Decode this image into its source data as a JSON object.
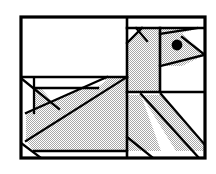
{
  "document": {
    "title": "Geometric Bird Figure",
    "kind": "line-art-illustration",
    "subject": "bird",
    "description": "Black-and-white geometric line drawing of a bird composed of straight-edged panels, diagonals and gray-filled polygons inside a rectangular frame.",
    "canvas": {
      "width": 216,
      "height": 174
    },
    "alt_text": "Angular geometric bird drawing with gray shaded body, pointed beak and round black eye, enclosed in a rectangular border."
  },
  "style": {
    "background_color": "#ffffff",
    "stroke_color": "#000000",
    "fill_gray": "#d2d2d2",
    "eye_color": "#000000",
    "frame_stroke_width": 3.2,
    "panel_stroke_width": 2.6,
    "detail_stroke_width": 2.2
  },
  "frame": {
    "name": "outer-border",
    "x": 21,
    "y": 17,
    "width": 184,
    "height": 141
  },
  "panels": [
    {
      "name": "panel-top-left",
      "x": 21,
      "y": 17,
      "width": 106,
      "height": 60,
      "fill": "white"
    },
    {
      "name": "panel-top-right-strip",
      "x": 127,
      "y": 17,
      "width": 78,
      "height": 11,
      "fill": "white"
    },
    {
      "name": "panel-head",
      "x": 127,
      "y": 28,
      "width": 78,
      "height": 64,
      "fill": "mixed"
    },
    {
      "name": "panel-mid-left",
      "x": 21,
      "y": 77,
      "width": 106,
      "height": 81,
      "fill": "mixed"
    },
    {
      "name": "panel-bottom-right",
      "x": 127,
      "y": 92,
      "width": 78,
      "height": 66,
      "fill": "mixed"
    }
  ],
  "divider_lines": [
    {
      "name": "divider-vertical-main",
      "x1": 127,
      "y1": 17,
      "x2": 127,
      "y2": 158
    },
    {
      "name": "divider-horizontal-left",
      "x1": 21,
      "y1": 77,
      "x2": 127,
      "y2": 77
    },
    {
      "name": "divider-horizontal-top-right",
      "x1": 127,
      "y1": 28,
      "x2": 205,
      "y2": 28
    },
    {
      "name": "divider-horizontal-mid-right",
      "x1": 127,
      "y1": 92,
      "x2": 205,
      "y2": 92
    },
    {
      "name": "divider-vertical-head",
      "x1": 160,
      "y1": 28,
      "x2": 160,
      "y2": 92
    }
  ],
  "shapes": {
    "body": {
      "name": "bird-body",
      "fill": "gray",
      "points": "127,77 127,150 33,150 27,140 27,112 60,96 106,77"
    },
    "body_lower": {
      "name": "bird-body-lower-wedge",
      "fill": "gray",
      "points": "27,112 60,96 106,77 127,77 127,150 33,150"
    },
    "neck": {
      "name": "bird-neck",
      "fill": "gray",
      "points": "127,42 140,30 160,30 160,92 127,92"
    },
    "head": {
      "name": "bird-head",
      "fill": "gray",
      "points": "160,30 175,29 200,50 203,55 180,66 160,66"
    },
    "beak": {
      "name": "bird-beak",
      "fill": "gray",
      "points": "185,40 203,55 186,62"
    },
    "leg_band": {
      "name": "bird-leg-band",
      "fill": "gray",
      "points": "140,95 160,95 196,150 175,150"
    },
    "tail_wedge": {
      "name": "bird-tail-wedge",
      "fill": "gray",
      "points": "127,95 140,95 160,150 127,150"
    }
  },
  "detail_lines": [
    {
      "name": "wing-diagonal-long",
      "x1": 27,
      "y1": 140,
      "x2": 127,
      "y2": 77
    },
    {
      "name": "wing-diagonal-upper",
      "x1": 27,
      "y1": 112,
      "x2": 106,
      "y2": 77
    },
    {
      "name": "wing-inner-edge",
      "x1": 27,
      "y1": 79,
      "x2": 60,
      "y2": 108
    },
    {
      "name": "wing-inner-brace",
      "x1": 33,
      "y1": 80,
      "x2": 33,
      "y2": 112
    },
    {
      "name": "wing-crossbar",
      "x1": 33,
      "y1": 88,
      "x2": 95,
      "y2": 88
    },
    {
      "name": "tail-notch",
      "x1": 21,
      "y1": 144,
      "x2": 40,
      "y2": 158
    },
    {
      "name": "neck-front-diagonal",
      "x1": 127,
      "y1": 42,
      "x2": 143,
      "y2": 28
    },
    {
      "name": "neck-back-diagonal",
      "x1": 135,
      "y1": 28,
      "x2": 146,
      "y2": 40
    },
    {
      "name": "head-top-diagonal",
      "x1": 160,
      "y1": 33,
      "x2": 196,
      "y2": 28
    },
    {
      "name": "head-under-diagonal",
      "x1": 160,
      "y1": 66,
      "x2": 203,
      "y2": 55
    },
    {
      "name": "beak-upper-edge",
      "x1": 183,
      "y1": 38,
      "x2": 205,
      "y2": 55
    },
    {
      "name": "leg-band-left-edge",
      "x1": 140,
      "y1": 95,
      "x2": 196,
      "y2": 152
    },
    {
      "name": "leg-band-right-edge",
      "x1": 160,
      "y1": 95,
      "x2": 205,
      "y2": 143
    },
    {
      "name": "tail-lower-edge",
      "x1": 127,
      "y1": 138,
      "x2": 152,
      "y2": 158
    }
  ],
  "eye": {
    "name": "bird-eye",
    "center_x": 177,
    "center_y": 45,
    "radius": 5.4,
    "color": "#000000"
  }
}
